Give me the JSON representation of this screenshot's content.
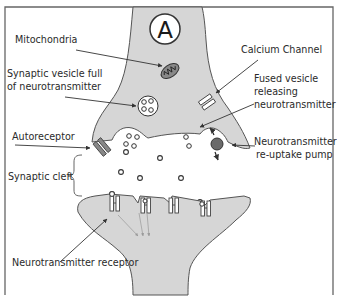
{
  "diagram": {
    "title_marker": "A",
    "type": "synapse",
    "colors": {
      "neuron_fill": "#d6d6d6",
      "outline": "#555555",
      "pump": "#6a6a6a",
      "frame": "#666666",
      "background": "#ffffff"
    },
    "labels": {
      "mitochondria": "Mitochondria",
      "synaptic_vesicle_line1": "Synaptic vesicle full",
      "synaptic_vesicle_line2": "of neurotransmitter",
      "autoreceptor": "Autoreceptor",
      "synaptic_cleft": "Synaptic cleft",
      "calcium_channel": "Calcium Channel",
      "fused_vesicle_line1": "Fused vesicle",
      "fused_vesicle_line2": "releasing",
      "fused_vesicle_line3": "neurotransmitter",
      "reuptake_line1": "Neurotransmitter",
      "reuptake_line2": "re-uptake pump",
      "receptor": "Neurotransmitter receptor"
    }
  }
}
